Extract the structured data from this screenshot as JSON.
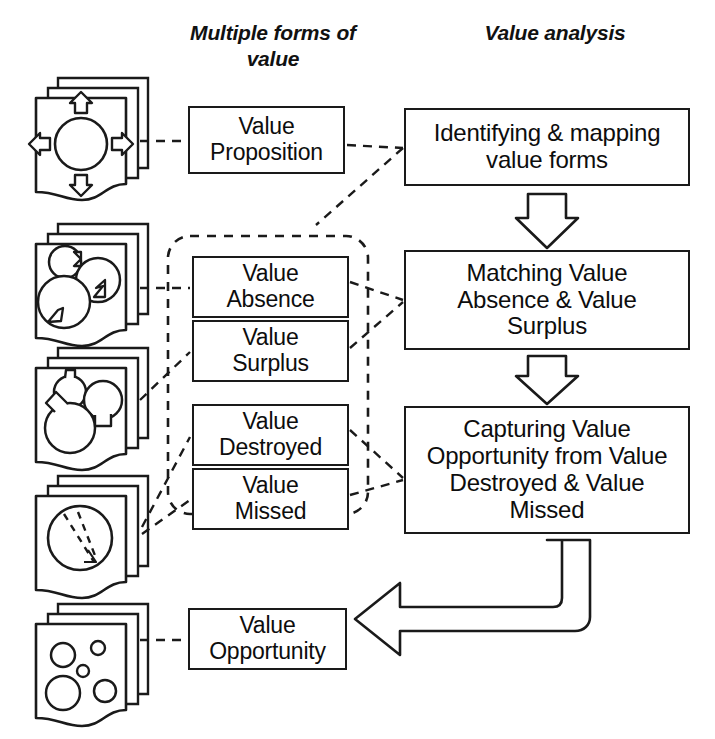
{
  "diagram": {
    "titles": {
      "left_column": "Multiple forms\nof value",
      "right_column": "Value analysis"
    },
    "value_forms": [
      {
        "id": "proposition",
        "label": "Value\nProposition",
        "icon": "four-arrows-circle-icon"
      },
      {
        "id": "absence",
        "label": "Value\nAbsence",
        "icon": "notched-circles-icon"
      },
      {
        "id": "surplus",
        "label": "Value\nSurplus",
        "icon": "bulging-circles-icon"
      },
      {
        "id": "destroyed",
        "label": "Value\nDestroyed",
        "icon": "dashed-split-circle-icon"
      },
      {
        "id": "missed",
        "label": "Value\nMissed",
        "icon": "dashed-split-circle-icon"
      },
      {
        "id": "opportunity",
        "label": "Value\nOpportunity",
        "icon": "scattered-circles-icon"
      }
    ],
    "analysis_steps": [
      {
        "id": "identify",
        "label": "Identifying & mapping\nvalue forms"
      },
      {
        "id": "matching",
        "label": "Matching Value\nAbsence & Value\nSurplus"
      },
      {
        "id": "capturing",
        "label": "Capturing Value\nOpportunity from Value\nDestroyed & Value\nMissed"
      }
    ],
    "group_box": {
      "name": "value-gap-group",
      "style": "dashed-rounded-rectangle"
    },
    "flow_arrows": [
      {
        "id": "identify-to-matching",
        "style": "block-arrow-down"
      },
      {
        "id": "matching-to-capturing",
        "style": "block-arrow-down"
      },
      {
        "id": "capturing-to-opportunity",
        "style": "block-arrow-elbow-left"
      }
    ],
    "connectors": [
      {
        "from": "icon-proposition",
        "to": "proposition"
      },
      {
        "from": "proposition",
        "to": "identify"
      },
      {
        "from": "icon-absence",
        "to": "absence"
      },
      {
        "from": "icon-surplus",
        "to": "surplus"
      },
      {
        "from": "icon-missed",
        "to": "destroyed"
      },
      {
        "from": "icon-missed",
        "to": "missed"
      },
      {
        "from": "absence",
        "to": "matching"
      },
      {
        "from": "surplus",
        "to": "matching"
      },
      {
        "from": "destroyed",
        "to": "capturing"
      },
      {
        "from": "missed",
        "to": "capturing"
      },
      {
        "from": "icon-opportunity",
        "to": "opportunity"
      }
    ],
    "colors": {
      "stroke": "#1a1a1a",
      "background": "#ffffff",
      "text": "#0d0d0d"
    }
  }
}
